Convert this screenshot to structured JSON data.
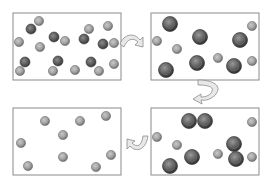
{
  "diagram": {
    "type": "process-cycle",
    "colors": {
      "box_border": "#8a8a8a",
      "small_particle": "#9a9a9a",
      "small_particle_rim": "#6e6e6e",
      "large_particle": "#5a5a5a",
      "large_particle_rim": "#3a3a3a",
      "arrow_fill": "#e6e6e6",
      "arrow_stroke": "#8a8a8a"
    },
    "panels": [
      {
        "id": "panel-1",
        "position": "top-left",
        "box": {
          "x": 13,
          "y": 13,
          "w": 108,
          "h": 67
        },
        "small": [
          [
            39,
            21
          ],
          [
            19,
            42
          ],
          [
            40,
            47
          ],
          [
            89,
            29
          ],
          [
            108,
            26
          ],
          [
            65,
            41
          ],
          [
            114,
            43
          ],
          [
            20,
            71
          ],
          [
            53,
            71
          ],
          [
            75,
            70
          ],
          [
            99,
            71
          ],
          [
            114,
            64
          ]
        ],
        "dark_small": [
          [
            31,
            29
          ],
          [
            54,
            37
          ],
          [
            84,
            39
          ],
          [
            103,
            44
          ],
          [
            25,
            62
          ],
          [
            58,
            61
          ],
          [
            91,
            62
          ]
        ]
      },
      {
        "id": "panel-2",
        "position": "top-right",
        "box": {
          "x": 151,
          "y": 13,
          "w": 108,
          "h": 67
        },
        "small": [
          [
            157,
            41
          ],
          [
            177,
            49
          ],
          [
            218,
            58
          ],
          [
            252,
            26
          ],
          [
            252,
            61
          ]
        ],
        "large": [
          [
            170,
            24
          ],
          [
            200,
            37
          ],
          [
            240,
            40
          ],
          [
            197,
            63
          ],
          [
            234,
            66
          ],
          [
            166,
            70
          ]
        ]
      },
      {
        "id": "panel-3",
        "position": "bottom-left",
        "box": {
          "x": 13,
          "y": 108,
          "w": 108,
          "h": 67
        },
        "small": [
          [
            45,
            121
          ],
          [
            80,
            121
          ],
          [
            106,
            116
          ],
          [
            63,
            135
          ],
          [
            21,
            143
          ],
          [
            63,
            157
          ],
          [
            111,
            155
          ],
          [
            28,
            166
          ],
          [
            96,
            167
          ]
        ]
      },
      {
        "id": "panel-4",
        "position": "bottom-right",
        "box": {
          "x": 151,
          "y": 108,
          "w": 108,
          "h": 67
        },
        "small": [
          [
            157,
            137
          ],
          [
            177,
            145
          ],
          [
            218,
            154
          ],
          [
            252,
            122
          ],
          [
            252,
            157
          ]
        ],
        "large": [
          [
            189,
            121
          ],
          [
            205,
            121
          ],
          [
            234,
            144
          ],
          [
            236,
            159
          ],
          [
            192,
            157
          ],
          [
            170,
            166
          ]
        ]
      }
    ],
    "arrows": [
      {
        "id": "arrow-1-to-2",
        "from": "panel-1",
        "to": "panel-2",
        "direction": "right"
      },
      {
        "id": "arrow-2-to-4",
        "from": "panel-2",
        "to": "panel-4",
        "direction": "down"
      },
      {
        "id": "arrow-4-to-3",
        "from": "panel-4",
        "to": "panel-3",
        "direction": "left"
      }
    ]
  }
}
